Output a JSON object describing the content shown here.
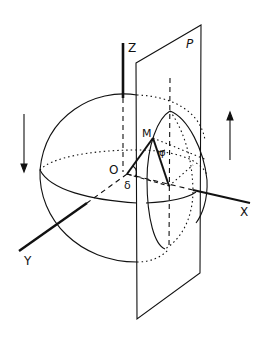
{
  "diagram": {
    "type": "geometry-3d",
    "labels": {
      "z_axis": "Z",
      "x_axis": "X",
      "y_axis": "Y",
      "plane": "P",
      "origin": "O",
      "point": "M",
      "angle_delta": "δ",
      "angle_phi": "φ"
    },
    "arrows": [
      {
        "name": "left-arrow",
        "direction": "down"
      },
      {
        "name": "right-arrow",
        "direction": "up"
      }
    ],
    "colors": {
      "ink": "#111111",
      "background": "#ffffff"
    }
  }
}
